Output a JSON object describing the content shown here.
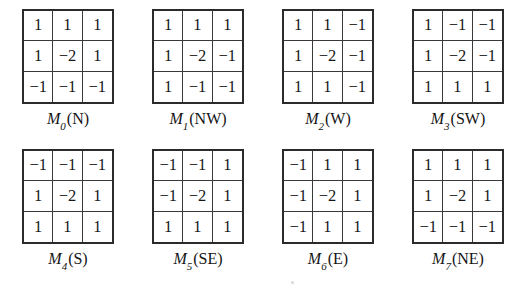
{
  "figure": {
    "background_color": "#ffffff",
    "line_color": "#2b2b2b",
    "text_color": "#171717",
    "grid_rows": 3,
    "grid_cols": 3,
    "layout": {
      "rows": 2,
      "columns": 4
    }
  },
  "chart_data": {
    "type": "table",
    "title": "",
    "matrices": [
      {
        "id": "M0",
        "name": "M",
        "subscript": "0",
        "direction": "N",
        "label": "M0(N)",
        "values": [
          [
            1,
            1,
            1
          ],
          [
            1,
            -2,
            1
          ],
          [
            -1,
            -1,
            -1
          ]
        ],
        "display": [
          [
            "1",
            "1",
            "1"
          ],
          [
            "1",
            "−2",
            "1"
          ],
          [
            "−1",
            "−1",
            "−1"
          ]
        ]
      },
      {
        "id": "M1",
        "name": "M",
        "subscript": "1",
        "direction": "NW",
        "label": "M1(NW)",
        "values": [
          [
            1,
            1,
            1
          ],
          [
            1,
            -2,
            -1
          ],
          [
            1,
            -1,
            -1
          ]
        ],
        "display": [
          [
            "1",
            "1",
            "1"
          ],
          [
            "1",
            "−2",
            "−1"
          ],
          [
            "1",
            "−1",
            "−1"
          ]
        ]
      },
      {
        "id": "M2",
        "name": "M",
        "subscript": "2",
        "direction": "W",
        "label": "M2(W)",
        "values": [
          [
            1,
            1,
            -1
          ],
          [
            1,
            -2,
            -1
          ],
          [
            1,
            1,
            -1
          ]
        ],
        "display": [
          [
            "1",
            "1",
            "−1"
          ],
          [
            "1",
            "−2",
            "−1"
          ],
          [
            "1",
            "1",
            "−1"
          ]
        ]
      },
      {
        "id": "M3",
        "name": "M",
        "subscript": "3",
        "direction": "SW",
        "label": "M3(SW)",
        "values": [
          [
            1,
            -1,
            -1
          ],
          [
            1,
            -2,
            -1
          ],
          [
            1,
            1,
            1
          ]
        ],
        "display": [
          [
            "1",
            "−1",
            "−1"
          ],
          [
            "1",
            "−2",
            "−1"
          ],
          [
            "1",
            "1",
            "1"
          ]
        ]
      },
      {
        "id": "M4",
        "name": "M",
        "subscript": "4",
        "direction": "S",
        "label": "M4(S)",
        "values": [
          [
            -1,
            -1,
            -1
          ],
          [
            1,
            -2,
            1
          ],
          [
            1,
            1,
            1
          ]
        ],
        "display": [
          [
            "−1",
            "−1",
            "−1"
          ],
          [
            "1",
            "−2",
            "1"
          ],
          [
            "1",
            "1",
            "1"
          ]
        ]
      },
      {
        "id": "M5",
        "name": "M",
        "subscript": "5",
        "direction": "SE",
        "label": "M5(SE)",
        "values": [
          [
            -1,
            -1,
            1
          ],
          [
            -1,
            -2,
            1
          ],
          [
            1,
            1,
            1
          ]
        ],
        "display": [
          [
            "−1",
            "−1",
            "1"
          ],
          [
            "−1",
            "−2",
            "1"
          ],
          [
            "1",
            "1",
            "1"
          ]
        ]
      },
      {
        "id": "M6",
        "name": "M",
        "subscript": "6",
        "direction": "E",
        "label": "M6(E)",
        "values": [
          [
            -1,
            1,
            1
          ],
          [
            -1,
            -2,
            1
          ],
          [
            -1,
            1,
            1
          ]
        ],
        "display": [
          [
            "−1",
            "1",
            "1"
          ],
          [
            "−1",
            "−2",
            "1"
          ],
          [
            "−1",
            "1",
            "1"
          ]
        ]
      },
      {
        "id": "M7",
        "name": "M",
        "subscript": "7",
        "direction": "NE",
        "label": "M7(NE)",
        "values": [
          [
            1,
            1,
            1
          ],
          [
            1,
            -2,
            1
          ],
          [
            -1,
            -1,
            -1
          ]
        ],
        "display": [
          [
            "1",
            "1",
            "1"
          ],
          [
            "1",
            "−2",
            "1"
          ],
          [
            "−1",
            "−1",
            "−1"
          ]
        ]
      }
    ]
  }
}
